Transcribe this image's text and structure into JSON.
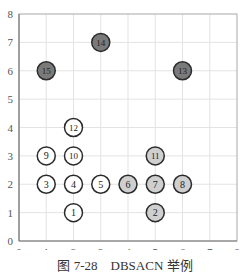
{
  "chart_data": {
    "type": "scatter",
    "title": "",
    "caption": "图 7-28　DBSACN 举例",
    "xlabel": "",
    "ylabel": "",
    "xlim": [
      0,
      8
    ],
    "ylim": [
      0,
      8
    ],
    "xticks": [
      "0",
      "1",
      "2",
      "3",
      "4",
      "5",
      "6",
      "7",
      "8"
    ],
    "yticks": [
      "0",
      "1",
      "2",
      "3",
      "4",
      "5",
      "6",
      "7",
      "8"
    ],
    "grid": true,
    "legend": null,
    "points": [
      {
        "label": "1",
        "x": 2,
        "y": 1,
        "group": "white"
      },
      {
        "label": "2",
        "x": 5,
        "y": 1,
        "group": "light"
      },
      {
        "label": "3",
        "x": 1,
        "y": 2,
        "group": "white"
      },
      {
        "label": "4",
        "x": 2,
        "y": 2,
        "group": "white"
      },
      {
        "label": "5",
        "x": 3,
        "y": 2,
        "group": "white"
      },
      {
        "label": "6",
        "x": 4,
        "y": 2,
        "group": "light"
      },
      {
        "label": "7",
        "x": 5,
        "y": 2,
        "group": "light"
      },
      {
        "label": "8",
        "x": 6,
        "y": 2,
        "group": "light"
      },
      {
        "label": "9",
        "x": 1,
        "y": 3,
        "group": "white"
      },
      {
        "label": "10",
        "x": 2,
        "y": 3,
        "group": "white"
      },
      {
        "label": "11",
        "x": 5,
        "y": 3,
        "group": "light"
      },
      {
        "label": "12",
        "x": 2,
        "y": 4,
        "group": "white"
      },
      {
        "label": "13",
        "x": 6,
        "y": 6,
        "group": "dark"
      },
      {
        "label": "14",
        "x": 3,
        "y": 7,
        "group": "dark"
      },
      {
        "label": "15",
        "x": 1,
        "y": 6,
        "group": "dark"
      }
    ],
    "group_colors": {
      "white": "#ffffff",
      "light": "#cfcfcf",
      "dark": "#7a7a7a"
    }
  },
  "caption": "图 7-28　DBSACN 举例"
}
